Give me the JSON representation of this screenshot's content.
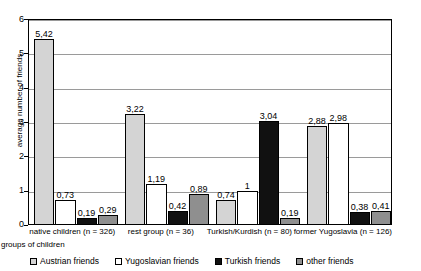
{
  "chart_data": {
    "type": "bar",
    "title": "",
    "xlabel": "groups of children",
    "ylabel": "average number of friends",
    "ylim": [
      0,
      6
    ],
    "yticks": [
      "0",
      "1",
      "2",
      "3",
      "4",
      "5",
      "6"
    ],
    "grid": true,
    "legend_position": "bottom",
    "categories": [
      "native children (n = 326)",
      "rest group (n = 36)",
      "Turkish/Kurdish (n = 80)",
      "former Yugoslavia (n = 126)"
    ],
    "series": [
      {
        "name": "Austrian friends",
        "color": "#d4d4d4",
        "values": [
          5.42,
          3.22,
          0.74,
          2.88
        ],
        "labels": [
          "5,42",
          "3,22",
          "0,74",
          "2,88"
        ]
      },
      {
        "name": "Yugoslavian friends",
        "color": "#ffffff",
        "values": [
          0.73,
          1.19,
          1.0,
          2.98
        ],
        "labels": [
          "0,73",
          "1,19",
          "1",
          "2,98"
        ]
      },
      {
        "name": "Turkish friends",
        "color": "#111111",
        "values": [
          0.19,
          0.42,
          3.04,
          0.38
        ],
        "labels": [
          "0,19",
          "0,42",
          "3,04",
          "0,38"
        ]
      },
      {
        "name": "other friends",
        "color": "#8f8f8f",
        "values": [
          0.29,
          0.89,
          0.19,
          0.41
        ],
        "labels": [
          "0,29",
          "0,89",
          "0,19",
          "0,41"
        ]
      }
    ]
  }
}
